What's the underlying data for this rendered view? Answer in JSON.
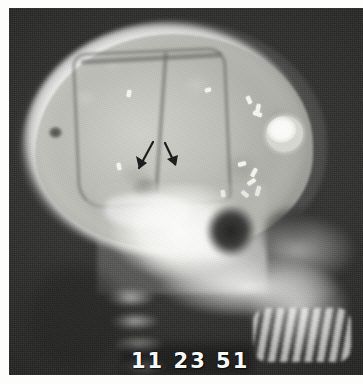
{
  "figure": {
    "modality": "plain-film-radiograph",
    "view": "lateral-skull",
    "caption": "",
    "background_color": "#2a2a29",
    "plate_color": "#d6d6d0",
    "bone_color": "#ffffff"
  },
  "stamp": {
    "text": "11 23 51",
    "kind": "date-stamp",
    "color": "#ffffff"
  },
  "annotations": {
    "arrow_color": "#1a1a1a",
    "arrows": [
      {
        "name": "arrow-left",
        "label": "",
        "direction": "down-left",
        "x": 130,
        "y": 140,
        "length": 26
      },
      {
        "name": "arrow-right",
        "label": "",
        "direction": "down-right",
        "x": 156,
        "y": 140,
        "length": 20
      }
    ]
  },
  "findings": {
    "craniotomy_flap": "bone flap outline",
    "round_opacity": "round radiopaque lesion",
    "surgical_clips_count": 9,
    "lucency": "lucent defect"
  },
  "clips": [
    {
      "x": 238,
      "y": 88,
      "w": 4,
      "h": 8,
      "rot": -24
    },
    {
      "x": 247,
      "y": 96,
      "w": 4,
      "h": 9,
      "rot": 12
    },
    {
      "x": 244,
      "y": 104,
      "w": 9,
      "h": 4,
      "rot": 20
    },
    {
      "x": 229,
      "y": 154,
      "w": 8,
      "h": 4,
      "rot": -14
    },
    {
      "x": 243,
      "y": 160,
      "w": 4,
      "h": 9,
      "rot": 28
    },
    {
      "x": 238,
      "y": 172,
      "w": 9,
      "h": 4,
      "rot": -34
    },
    {
      "x": 247,
      "y": 178,
      "w": 4,
      "h": 10,
      "rot": 16
    },
    {
      "x": 232,
      "y": 184,
      "w": 8,
      "h": 4,
      "rot": 40
    },
    {
      "x": 212,
      "y": 182,
      "w": 4,
      "h": 7,
      "rot": -8
    },
    {
      "x": 118,
      "y": 82,
      "w": 4,
      "h": 7,
      "rot": 10
    },
    {
      "x": 196,
      "y": 80,
      "w": 6,
      "h": 4,
      "rot": -18
    },
    {
      "x": 108,
      "y": 155,
      "w": 4,
      "h": 7,
      "rot": -12
    }
  ]
}
